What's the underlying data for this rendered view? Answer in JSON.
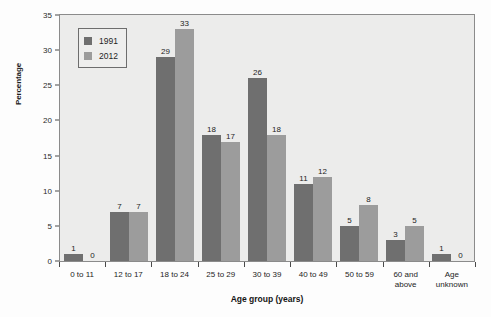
{
  "chart_data": {
    "type": "bar",
    "title": "",
    "xlabel": "Age group (years)",
    "ylabel": "Percentage",
    "ylim": [
      0,
      35
    ],
    "yticks": [
      0,
      5,
      10,
      15,
      20,
      25,
      30,
      35
    ],
    "grid": false,
    "legend_position": "top-left",
    "categories": [
      "0 to 11",
      "12 to 17",
      "18 to 24",
      "25 to 29",
      "30 to 39",
      "40 to 49",
      "50 to 59",
      "60 and above",
      "Age unknown"
    ],
    "series": [
      {
        "name": "1991",
        "color": "#6f6f6f",
        "values": [
          1,
          7,
          29,
          18,
          26,
          11,
          5,
          3,
          1
        ]
      },
      {
        "name": "2012",
        "color": "#9c9c9c",
        "values": [
          0,
          7,
          33,
          17,
          18,
          12,
          8,
          5,
          0
        ]
      }
    ]
  },
  "colors": {
    "series_1991": "#6f6f6f",
    "series_2012": "#9c9c9c",
    "plot_background": "#ececeb",
    "plot_border": "#8b8b8b",
    "page_background": "#fdfdfd"
  }
}
